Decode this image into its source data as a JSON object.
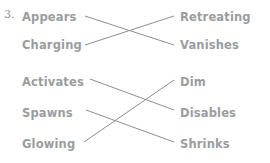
{
  "exercise": {
    "number": "3.",
    "groups": [
      {
        "id": "group-1",
        "left_items": [
          {
            "label": "Appears",
            "x": 22,
            "y": 11
          },
          {
            "label": "Charging",
            "x": 22,
            "y": 39
          }
        ],
        "right_items": [
          {
            "label": "Retreating",
            "x": 180,
            "y": 11
          },
          {
            "label": "Vanishes",
            "x": 180,
            "y": 39
          }
        ],
        "connections": [
          {
            "from": "Appears",
            "to": "Vanishes",
            "x1": 85,
            "y1": 16,
            "x2": 174,
            "y2": 45
          },
          {
            "from": "Charging",
            "to": "Retreating",
            "x1": 85,
            "y1": 45,
            "x2": 174,
            "y2": 16
          }
        ]
      },
      {
        "id": "group-2",
        "left_items": [
          {
            "label": "Activates",
            "x": 22,
            "y": 76
          },
          {
            "label": "Spawns",
            "x": 22,
            "y": 107
          },
          {
            "label": "Glowing",
            "x": 22,
            "y": 138
          }
        ],
        "right_items": [
          {
            "label": "Dim",
            "x": 180,
            "y": 76
          },
          {
            "label": "Disables",
            "x": 180,
            "y": 107
          },
          {
            "label": "Shrinks",
            "x": 180,
            "y": 138
          }
        ],
        "connections": [
          {
            "from": "Activates",
            "to": "Disables",
            "x1": 90,
            "y1": 79,
            "x2": 174,
            "y2": 110
          },
          {
            "from": "Spawns",
            "to": "Shrinks",
            "x1": 86,
            "y1": 110,
            "x2": 174,
            "y2": 142
          },
          {
            "from": "Glowing",
            "to": "Dim",
            "x1": 84,
            "y1": 142,
            "x2": 174,
            "y2": 80
          }
        ]
      }
    ]
  },
  "colors": {
    "text": "#9a9da0",
    "line": "#8b8e91",
    "background": "#ffffff"
  }
}
